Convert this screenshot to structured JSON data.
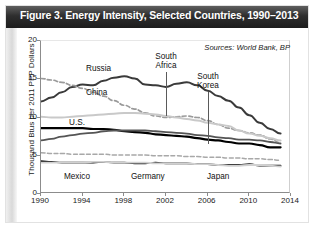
{
  "figure": {
    "title": "Figure 3. Energy Intensity, Selected Countries, 1990–2013",
    "sources": "Sources: World Bank, BP"
  },
  "axes": {
    "ylabel": "Thousand Btus per 2011 PPP Dollars",
    "yticks": [
      "0",
      "5",
      "10",
      "15",
      "20"
    ],
    "xticks": [
      "1990",
      "1994",
      "1998",
      "2002",
      "2006",
      "2010",
      "2014"
    ]
  },
  "annotations": {
    "russia": "Russia",
    "china": "China",
    "south_africa_l1": "South",
    "south_africa_l2": "Africa",
    "south_korea_l1": "South",
    "south_korea_l2": "Korea",
    "us": "U.S.",
    "mexico": "Mexico",
    "germany": "Germany",
    "japan": "Japan"
  },
  "colors": {
    "titlebar": "#1c1c1c",
    "title_text": "#ffffff",
    "russia": "#3a3a3a",
    "china": "#9a9a9a",
    "south_africa": "#c9c9c9",
    "united_states": "#000000",
    "south_korea": "#555555",
    "mexico": "#a8a8a8",
    "germany": "#111111",
    "japan": "#d0d0d0",
    "axis": "#8c8c8c"
  },
  "chart_data": {
    "type": "line",
    "title": "Figure 3. Energy Intensity, Selected Countries, 1990–2013",
    "xlabel": "",
    "ylabel": "Thousand Btus per 2011 PPP Dollars",
    "xlim": [
      1990,
      2014
    ],
    "ylim": [
      0,
      20
    ],
    "yticks": [
      0,
      5,
      10,
      15,
      20
    ],
    "xticks": [
      1990,
      1994,
      1998,
      2002,
      2006,
      2010,
      2014
    ],
    "grid": false,
    "legend": "inline-labels",
    "note": "Sources: World Bank, BP",
    "x": [
      1990,
      1991,
      1992,
      1993,
      1994,
      1995,
      1996,
      1997,
      1998,
      1999,
      2000,
      2001,
      2002,
      2003,
      2004,
      2005,
      2006,
      2007,
      2008,
      2009,
      2010,
      2011,
      2012,
      2013
    ],
    "series": [
      {
        "name": "Russia",
        "style": "solid",
        "color": "#3a3a3a",
        "values": [
          12.1,
          12.6,
          13.3,
          14.0,
          14.3,
          14.2,
          14.8,
          15.2,
          15.4,
          15.1,
          14.3,
          14.2,
          14.0,
          14.4,
          14.6,
          14.2,
          13.5,
          12.8,
          12.2,
          11.3,
          10.3,
          9.3,
          8.5,
          7.9
        ]
      },
      {
        "name": "China",
        "style": "dashed",
        "color": "#9a9a9a",
        "values": [
          15.1,
          14.9,
          14.6,
          14.2,
          13.8,
          13.3,
          12.8,
          12.2,
          11.6,
          11.1,
          10.6,
          10.2,
          10.0,
          10.1,
          10.2,
          10.0,
          9.6,
          9.1,
          8.6,
          8.3,
          8.0,
          7.7,
          7.2,
          6.7
        ]
      },
      {
        "name": "South Africa",
        "style": "solid",
        "color": "#c9c9c9",
        "values": [
          10.1,
          10.0,
          10.0,
          10.1,
          10.2,
          10.3,
          10.4,
          10.5,
          10.6,
          10.6,
          10.5,
          10.4,
          10.2,
          10.0,
          9.8,
          9.6,
          9.3,
          9.1,
          8.9,
          8.3,
          7.9,
          7.6,
          7.3,
          7.0
        ]
      },
      {
        "name": "U.S.",
        "style": "solid",
        "color": "#000000",
        "values": [
          8.6,
          8.6,
          8.6,
          8.6,
          8.6,
          8.5,
          8.5,
          8.4,
          8.2,
          8.1,
          8.0,
          7.8,
          7.7,
          7.6,
          7.5,
          7.3,
          7.1,
          7.0,
          6.8,
          6.6,
          6.6,
          6.4,
          6.1,
          6.1
        ]
      },
      {
        "name": "South Korea",
        "style": "solid",
        "color": "#555555",
        "values": [
          7.0,
          7.2,
          7.5,
          7.7,
          7.9,
          8.0,
          8.2,
          8.3,
          8.3,
          8.3,
          8.3,
          8.2,
          8.1,
          8.0,
          7.9,
          7.7,
          7.6,
          7.4,
          7.3,
          7.1,
          7.1,
          7.0,
          6.8,
          6.6
        ]
      },
      {
        "name": "Mexico",
        "style": "dashed",
        "color": "#a8a8a8",
        "values": [
          5.4,
          5.3,
          5.3,
          5.2,
          5.2,
          5.2,
          5.2,
          5.1,
          5.1,
          5.1,
          5.1,
          5.0,
          5.0,
          5.0,
          4.9,
          4.9,
          4.8,
          4.8,
          4.7,
          4.7,
          4.6,
          4.6,
          4.5,
          4.4
        ]
      },
      {
        "name": "Germany",
        "style": "solid",
        "color": "#111111",
        "values": [
          4.3,
          4.2,
          4.1,
          4.1,
          4.1,
          4.1,
          4.2,
          4.1,
          4.1,
          4.0,
          4.0,
          4.1,
          4.0,
          4.0,
          4.0,
          3.9,
          3.9,
          3.8,
          3.8,
          3.8,
          3.9,
          3.7,
          3.7,
          3.7
        ]
      },
      {
        "name": "Japan",
        "style": "solid",
        "color": "#d0d0d0",
        "values": [
          4.1,
          4.1,
          4.1,
          4.1,
          4.1,
          4.2,
          4.2,
          4.1,
          4.1,
          4.1,
          4.1,
          4.0,
          4.0,
          4.0,
          4.0,
          3.9,
          3.9,
          3.8,
          3.7,
          3.7,
          3.8,
          3.8,
          3.7,
          3.6
        ]
      }
    ]
  }
}
